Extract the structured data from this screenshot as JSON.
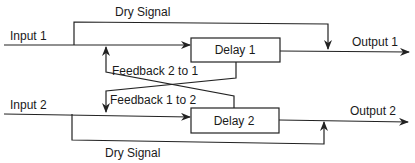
{
  "diagram": {
    "inputs": [
      {
        "label": "Input 1"
      },
      {
        "label": "Input 2"
      }
    ],
    "outputs": [
      {
        "label": "Output 1"
      },
      {
        "label": "Output 2"
      }
    ],
    "blocks": [
      {
        "label": "Delay 1"
      },
      {
        "label": "Delay 2"
      }
    ],
    "paths": {
      "dry_top": "Dry Signal",
      "dry_bottom": "Dry Signal",
      "feedback_2_to_1": "Feedback 2 to 1",
      "feedback_1_to_2": "Feedback 1 to 2"
    },
    "colors": {
      "line": "#222222",
      "background": "#ffffff"
    }
  }
}
